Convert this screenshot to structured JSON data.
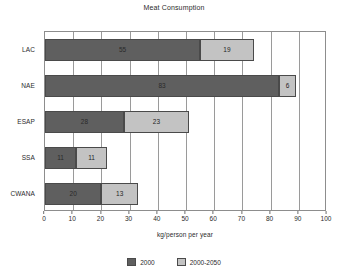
{
  "chart_data": {
    "type": "bar",
    "orientation": "horizontal",
    "stacked": true,
    "title": "Meat Consumption",
    "xlabel": "kg/person per year",
    "ylabel": "",
    "xlim": [
      0,
      100
    ],
    "xticks": [
      0,
      10,
      20,
      30,
      40,
      50,
      60,
      70,
      80,
      90,
      100
    ],
    "grid": true,
    "grid_axis": "x",
    "legend_position": "bottom",
    "categories": [
      "LAC",
      "NAE",
      "ESAP",
      "SSA",
      "CWANA"
    ],
    "series": [
      {
        "name": "2000",
        "color": "#5f5f5f",
        "values": [
          55,
          83,
          28,
          11,
          20
        ]
      },
      {
        "name": "2000-2050",
        "color": "#c3c3c3",
        "values": [
          19,
          6,
          23,
          11,
          13
        ]
      }
    ],
    "totals": [
      74,
      89,
      51,
      22,
      33
    ]
  },
  "legend": {
    "items": [
      {
        "label": "2000"
      },
      {
        "label": "2000-2050"
      }
    ]
  }
}
